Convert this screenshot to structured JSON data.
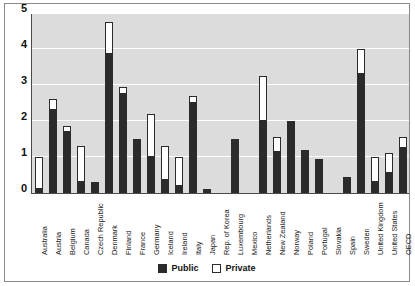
{
  "chart_data": {
    "type": "bar",
    "stacked": true,
    "title": "",
    "subtitle": "",
    "xlabel": "",
    "ylabel": "",
    "ylim": [
      0,
      5
    ],
    "yticks": [
      0,
      1,
      2,
      3,
      4,
      5
    ],
    "ytick_labels": [
      "0",
      "1",
      "2",
      "3",
      "4",
      "5"
    ],
    "grid": true,
    "legend_position": "bottom",
    "categories": [
      "Australia",
      "Austria",
      "Belgium",
      "Canada",
      "Czech Republic",
      "Denmark",
      "Finland",
      "France",
      "Germany",
      "Iceland",
      "Ireland",
      "Italy",
      "Japan",
      "Rep. of Korea",
      "Luxembourg",
      "Mexico",
      "Netherlands",
      "New Zealand",
      "Norway",
      "Poland",
      "Portugal",
      "Slovakia",
      "Spain",
      "Sweden",
      "United Kingdom",
      "United States",
      "OECD"
    ],
    "series": [
      {
        "name": "Public",
        "color": "#2b2b2b",
        "values": [
          0.1,
          2.3,
          1.7,
          0.3,
          0.3,
          3.85,
          2.75,
          1.5,
          1.0,
          0.35,
          0.2,
          2.5,
          0.1,
          0.0,
          1.45,
          0.0,
          2.0,
          1.15,
          1.95,
          1.2,
          0.95,
          0.0,
          0.45,
          3.3,
          0.3,
          0.55,
          1.25
        ],
        "gap_categories": [
          "Japan",
          "Mexico",
          "Slovakia"
        ]
      },
      {
        "name": "Private",
        "color": "#ffffff",
        "values": [
          0.9,
          0.3,
          0.15,
          1.0,
          0.0,
          0.9,
          0.2,
          0.0,
          1.2,
          0.95,
          0.8,
          0.2,
          0.0,
          0.0,
          0.05,
          0.0,
          1.25,
          0.4,
          0.05,
          0.0,
          0.0,
          0.0,
          0.0,
          0.7,
          0.7,
          0.55,
          0.3
        ]
      }
    ],
    "totals": [
      1.0,
      2.6,
      1.85,
      1.3,
      0.3,
      4.75,
      2.95,
      1.5,
      2.2,
      1.3,
      1.0,
      2.7,
      0.1,
      0.0,
      1.5,
      0.0,
      3.25,
      1.55,
      2.0,
      1.2,
      0.95,
      0.0,
      0.45,
      4.0,
      1.0,
      1.1,
      1.55
    ],
    "legend": [
      {
        "label": "Public",
        "swatch": "public"
      },
      {
        "label": "Private",
        "swatch": "private"
      }
    ],
    "colors": {
      "public": "#2b2b2b",
      "private": "#ffffff",
      "plot_background": "#dcdcdc",
      "gridline": "#ffffff",
      "axis": "#4a4a4a",
      "frame": "#8a8a8a",
      "text": "#111111"
    }
  }
}
